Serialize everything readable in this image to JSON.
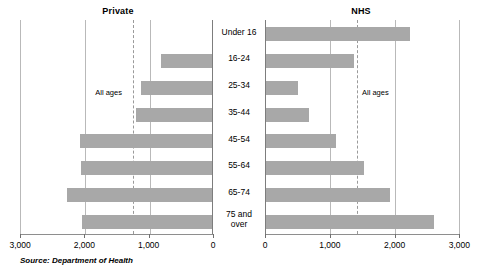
{
  "source_note": "Source: Department of Health",
  "annotation_label": "All ages",
  "panels": [
    {
      "title": "Private",
      "direction": "left"
    },
    {
      "title": "NHS",
      "direction": "right"
    }
  ],
  "axis_ticks": [
    "3,000",
    "2,000",
    "1,000",
    "0",
    "0",
    "1,000",
    "2,000",
    "3,000"
  ],
  "chart_data": {
    "type": "bar",
    "orientation": "horizontal",
    "layout": "back-to-back pyramid, two panels sharing central category axis",
    "categories": [
      "Under 16",
      "16-24",
      "25-34",
      "35-44",
      "45-54",
      "55-64",
      "65-74",
      "75 and over"
    ],
    "series": [
      {
        "name": "Private",
        "panel": "left",
        "values": [
          0,
          800,
          1110,
          1180,
          2050,
          2040,
          2250,
          2020
        ],
        "average_line": 1240
      },
      {
        "name": "NHS",
        "panel": "right",
        "values": [
          2215,
          1355,
          490,
          660,
          1080,
          1510,
          1910,
          2600
        ],
        "average_line": 1420
      }
    ],
    "xlabel": "",
    "ylabel": "",
    "xlim_left": [
      3000,
      0
    ],
    "xlim_right": [
      0,
      3000
    ],
    "tick_values": [
      0,
      1000,
      2000,
      3000
    ],
    "tick_labels": [
      "0",
      "1,000",
      "2,000",
      "3,000"
    ],
    "grid": true,
    "grid_color": "#b9b9b9",
    "bar_color": "#a8a8a8",
    "average_line_style": "dashed",
    "average_line_color": "#9a9a9a",
    "legend": "none",
    "annotations": [
      {
        "text": "All ages",
        "panel": "left",
        "value": 1240
      },
      {
        "text": "All ages",
        "panel": "right",
        "value": 1420
      }
    ]
  }
}
